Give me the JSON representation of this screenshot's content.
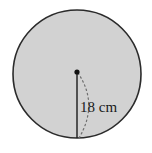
{
  "figure": {
    "type": "geometry-diagram",
    "background_color": "#ffffff",
    "circle": {
      "name": "shaded-circle",
      "center_x": 77,
      "center_y": 74,
      "radius": 64,
      "fill_color": "#d2d2d2",
      "stroke_color": "#2b2b2b",
      "stroke_width": 1.6
    },
    "center_point": {
      "name": "center-dot",
      "x": 77,
      "y": 72,
      "radius": 2.6,
      "color": "#111111"
    },
    "radius_segment": {
      "name": "radius-line",
      "x1": 77,
      "y1": 72,
      "x2": 77,
      "y2": 138,
      "color": "#1a1a1a",
      "stroke_width": 1.4
    },
    "dotted_arc": {
      "name": "radius-sweep-arc",
      "color": "#6e6e6e",
      "stroke_width": 1.2,
      "dash_pattern": "1.5 3",
      "start_x": 78,
      "start_y": 73,
      "control_x": 99,
      "control_y": 104,
      "end_x": 79,
      "end_y": 138
    },
    "label": {
      "name": "radius-measure-label",
      "text": "18 cm",
      "value": 18,
      "unit": "cm",
      "x": 80,
      "y": 112,
      "font_size": 15,
      "color": "#1a1a1a"
    }
  }
}
